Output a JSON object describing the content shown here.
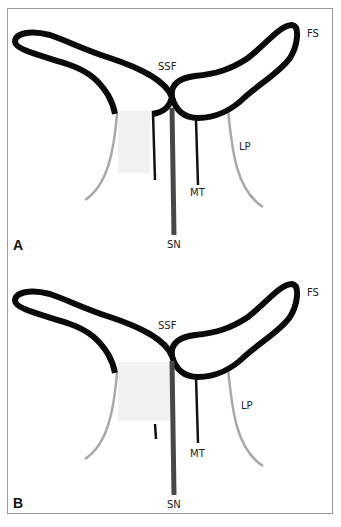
{
  "figure": {
    "panels": [
      {
        "id": "A",
        "panel_label": "A",
        "labels": {
          "fs": "FS",
          "ssf": "SSF",
          "lp": "LP",
          "mt": "MT",
          "sn": "SN"
        }
      },
      {
        "id": "B",
        "panel_label": "B",
        "labels": {
          "fs": "FS",
          "ssf": "SSF",
          "lp": "LP",
          "mt": "MT",
          "sn": "SN"
        }
      }
    ],
    "colors": {
      "outline": "#0a0a0a",
      "septal_nerve": "#474747",
      "lateral_pillar": "#a8a8a8",
      "shaded_region": "#f1f1f1",
      "frame": "#9a9a9a"
    }
  }
}
